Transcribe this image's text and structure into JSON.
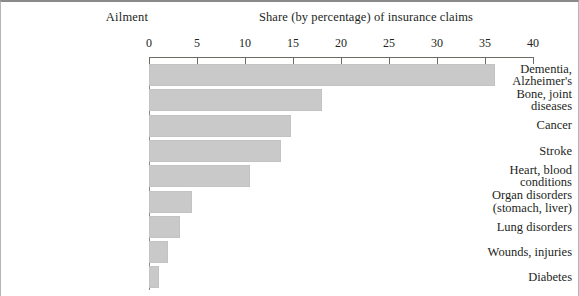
{
  "header": {
    "category_axis_title": "Ailment",
    "value_axis_title": "Share (by percentage) of insurance claims"
  },
  "chart_data": {
    "type": "bar",
    "orientation": "horizontal",
    "title": "Share (by percentage) of insurance claims",
    "xlabel": "Share (by percentage) of insurance claims",
    "ylabel": "Ailment",
    "xlim": [
      0,
      40
    ],
    "grid": false,
    "legend": null,
    "bar_color": "#c9c9c9",
    "axis_color": "#6e6a66",
    "tick_labels": [
      "0",
      "5",
      "10",
      "15",
      "20",
      "25",
      "30",
      "35",
      "40"
    ],
    "ticks": [
      0,
      5,
      10,
      15,
      20,
      25,
      30,
      35,
      40
    ],
    "categories": [
      "Dementia,\nAlzheimer's",
      "Bone, joint\ndiseases",
      "Cancer",
      "Stroke",
      "Heart, blood\nconditions",
      "Organ disorders\n(stomach, liver)",
      "Lung disorders",
      "Wounds, injuries",
      "Diabetes"
    ],
    "values": [
      36,
      18,
      14.8,
      13.8,
      10.5,
      4.5,
      3.2,
      2,
      1
    ]
  }
}
